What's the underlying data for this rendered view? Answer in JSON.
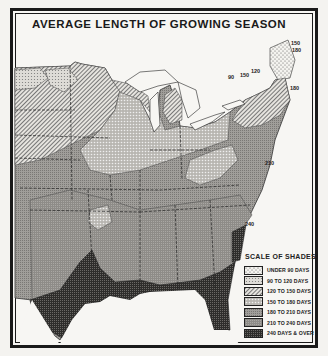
{
  "title": "AVERAGE LENGTH OF GROWING SEASON",
  "legend": {
    "title": "SCALE OF SHADES",
    "items": [
      {
        "label": "UNDER 90 DAYS",
        "pattern": "p0"
      },
      {
        "label": "90 TO 120 DAYS",
        "pattern": "p1"
      },
      {
        "label": "120 TO 150 DAYS",
        "pattern": "p2"
      },
      {
        "label": "150 TO 180 DAYS",
        "pattern": "p3"
      },
      {
        "label": "180 TO 210 DAYS",
        "pattern": "p4"
      },
      {
        "label": "210 TO 240 DAYS",
        "pattern": "p5"
      },
      {
        "label": "240 DAYS & OVER",
        "pattern": "p6"
      }
    ]
  },
  "contour_labels": [
    {
      "text": "150",
      "x": 240,
      "y": 75
    },
    {
      "text": "120",
      "x": 251,
      "y": 71
    },
    {
      "text": "90",
      "x": 228,
      "y": 77
    },
    {
      "text": "150",
      "x": 291,
      "y": 43
    },
    {
      "text": "180",
      "x": 292,
      "y": 50
    },
    {
      "text": "180",
      "x": 290,
      "y": 88
    },
    {
      "text": "210",
      "x": 265,
      "y": 163
    },
    {
      "text": "240",
      "x": 245,
      "y": 224
    }
  ]
}
